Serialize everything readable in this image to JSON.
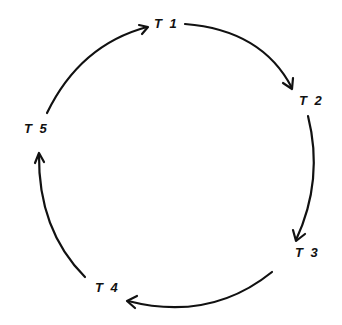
{
  "diagram": {
    "type": "cycle",
    "direction": "clockwise",
    "nodes": [
      {
        "id": "T1",
        "label": "T 1"
      },
      {
        "id": "T2",
        "label": "T 2"
      },
      {
        "id": "T3",
        "label": "T 3"
      },
      {
        "id": "T4",
        "label": "T 4"
      },
      {
        "id": "T5",
        "label": "T 5"
      }
    ],
    "edges": [
      {
        "from": "T1",
        "to": "T2"
      },
      {
        "from": "T2",
        "to": "T3"
      },
      {
        "from": "T3",
        "to": "T4"
      },
      {
        "from": "T4",
        "to": "T5"
      },
      {
        "from": "T5",
        "to": "T1"
      }
    ],
    "colors": {
      "stroke": "#111111",
      "background": "#ffffff"
    }
  }
}
